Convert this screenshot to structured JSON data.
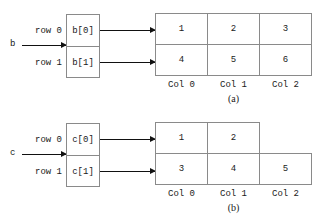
{
  "figures": [
    {
      "id": "a",
      "variable": "b",
      "caption": "(a)",
      "row_labels": [
        "row 0",
        "row 1"
      ],
      "pointer_cells": [
        "b[0]",
        "b[1]"
      ],
      "column_labels": [
        "Col 0",
        "Col 1",
        "Col 2"
      ],
      "rows": [
        {
          "label": "row 0",
          "values": [
            "1",
            "2",
            "3"
          ]
        },
        {
          "label": "row 1",
          "values": [
            "4",
            "5",
            "6"
          ]
        }
      ]
    },
    {
      "id": "b",
      "variable": "c",
      "caption": "(b)",
      "row_labels": [
        "row 0",
        "row 1"
      ],
      "pointer_cells": [
        "c[0]",
        "c[1]"
      ],
      "column_labels": [
        "Col 0",
        "Col 1",
        "Col 2"
      ],
      "rows": [
        {
          "label": "row 0",
          "values": [
            "1",
            "2"
          ]
        },
        {
          "label": "row 1",
          "values": [
            "3",
            "4",
            "5"
          ]
        }
      ]
    }
  ],
  "colors": {
    "line": "#8a8a8a",
    "arrow": "#111111",
    "text": "#1a1a1a",
    "background": "#ffffff"
  }
}
